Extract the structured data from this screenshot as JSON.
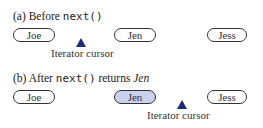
{
  "panel_a": {
    "caption_prefix": "(a) Before ",
    "caption_code": "next()",
    "nodes": [
      "Joe",
      "Jen",
      "Jess"
    ],
    "cursor_label": "Iterator cursor"
  },
  "panel_b": {
    "caption_prefix": "(b) After ",
    "caption_code": "next()",
    "caption_middle": " returns ",
    "caption_italic": "Jen",
    "nodes": [
      "Joe",
      "Jen",
      "Jess"
    ],
    "highlighted_node": "Jen",
    "cursor_label": "Iterator cursor"
  },
  "colors": {
    "highlight_fill": "#c9d1ee",
    "cursor_triangle": "#1f2a7a"
  }
}
